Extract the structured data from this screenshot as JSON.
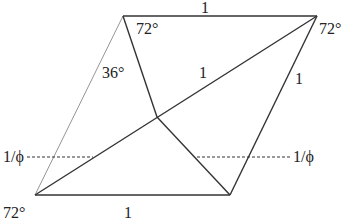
{
  "colors": {
    "stroke": "#333333",
    "light_stroke": "#888888",
    "text": "#222222",
    "background": "#ffffff"
  },
  "vertices": {
    "top_left": [
      123,
      16
    ],
    "top_right": [
      317,
      16
    ],
    "bottom_left": [
      35,
      195
    ],
    "bottom_right": [
      230,
      195
    ],
    "interior": [
      157,
      117
    ]
  },
  "labels": {
    "top_edge": "1",
    "bottom_edge": "1",
    "diagonal": "1",
    "right_edge": "1",
    "angle_top_left": "72°",
    "angle_top_right": "72°",
    "angle_bottom_left": "72°",
    "angle_left_apex": "36°",
    "height_left": "1/ϕ",
    "height_right": "1/ϕ"
  }
}
